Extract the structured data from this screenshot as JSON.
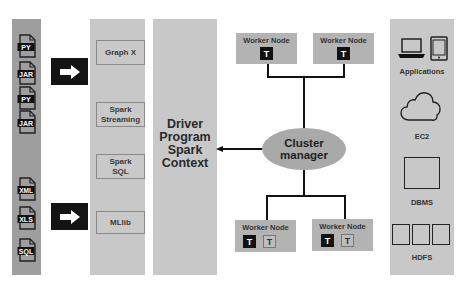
{
  "diagram": {
    "input_files": {
      "group1": [
        "PY",
        "JAR",
        "PY",
        "JAR"
      ],
      "group2": [
        "XML",
        "XLS",
        "SQL"
      ]
    },
    "arrows": [
      "right-arrow",
      "right-arrow"
    ],
    "libraries": [
      "Graph X",
      "Spark\nStreaming",
      "Spark\nSQL",
      "MLlib"
    ],
    "driver": {
      "line1": "Driver",
      "line2": "Program",
      "line3": "Spark",
      "line4": "Context"
    },
    "cluster_manager": {
      "line1": "Cluster",
      "line2": "manager"
    },
    "worker_nodes": [
      {
        "label": "Worker Node",
        "tasks": [
          "T"
        ]
      },
      {
        "label": "Worker Node",
        "tasks": [
          "T"
        ]
      },
      {
        "label": "Worker Node",
        "tasks": [
          "T",
          "T"
        ]
      },
      {
        "label": "Worker Node",
        "tasks": [
          "T",
          "T"
        ]
      }
    ],
    "resources": [
      "Applications",
      "EC2",
      "DBMS",
      "HDFS"
    ]
  },
  "colors": {
    "strip": "#9e9e9e",
    "column": "#c8c8c8",
    "worker": "#b3b3b3",
    "ellipse": "#a9a9a9",
    "arrow_box": "#141414"
  }
}
